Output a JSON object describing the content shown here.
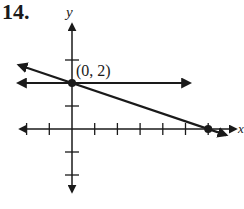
{
  "problem": {
    "number": "14."
  },
  "chart_data": {
    "type": "line",
    "title": "",
    "xlabel": "x",
    "ylabel": "y",
    "xlim": [
      -2,
      7
    ],
    "ylim": [
      -3,
      4
    ],
    "grid": false,
    "x_ticks": [
      -2,
      -1,
      1,
      2,
      3,
      4,
      5,
      6
    ],
    "y_ticks": [
      -2,
      -1,
      1,
      2,
      3
    ],
    "series": [
      {
        "name": "y = 2",
        "equation": "y = 2",
        "slope": 0,
        "intercept": 2,
        "x": [
          -2,
          7
        ],
        "y": [
          2,
          2
        ]
      },
      {
        "name": "y = -1/3 x + 2",
        "equation": "y = -x/3 + 2",
        "slope": -0.3333,
        "intercept": 2,
        "x": [
          -2,
          7
        ],
        "y": [
          2.667,
          -0.333
        ]
      }
    ],
    "points": [
      {
        "label": "(0, 2)",
        "x": 0,
        "y": 2
      },
      {
        "label": "",
        "x": 6,
        "y": 0
      }
    ],
    "annotations": [
      {
        "text": "(0, 2)",
        "x": 0,
        "y": 2
      }
    ]
  },
  "labels": {
    "x_axis": "x",
    "y_axis": "y",
    "point": "(0, 2)"
  }
}
